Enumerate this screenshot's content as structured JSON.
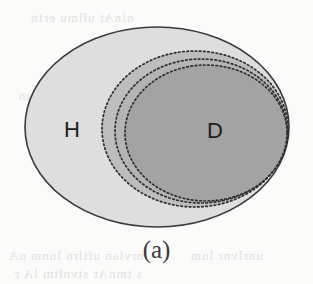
{
  "figure": {
    "caption": "(a)",
    "type": "venn-diagram",
    "background_color": "#fbfbfa",
    "sets": [
      {
        "id": "H",
        "label": "H",
        "label_x": 72,
        "label_y": 137,
        "shape": "ellipse",
        "cx": 157,
        "cy": 127,
        "rx": 132,
        "ry": 100,
        "fill": "#dedede",
        "stroke": "#3b3b3b",
        "stroke_style": "solid",
        "stroke_width": 1.6
      },
      {
        "id": "D3",
        "label": "",
        "shape": "ellipse",
        "cx": 195,
        "cy": 129,
        "rx": 93,
        "ry": 78,
        "fill": "#bdbdbd",
        "stroke": "#2e2e2e",
        "stroke_style": "dotted",
        "stroke_width": 1.7
      },
      {
        "id": "D2",
        "label": "",
        "shape": "ellipse",
        "cx": 201,
        "cy": 131,
        "rx": 86,
        "ry": 72,
        "fill": "#b4b4b4",
        "stroke": "#2e2e2e",
        "stroke_style": "dotted",
        "stroke_width": 1.7
      },
      {
        "id": "D",
        "label": "D",
        "label_x": 215,
        "label_y": 138,
        "shape": "ellipse",
        "cx": 206,
        "cy": 133,
        "rx": 81,
        "ry": 68,
        "fill": "#a3a3a3",
        "stroke": "#2e2e2e",
        "stroke_style": "dotted",
        "stroke_width": 1.7
      }
    ],
    "bleed_artifacts": [
      "bleed-line-top",
      "bleed-line-upper",
      "bleed-line-lower-left",
      "bleed-line-bottom",
      "bleed-line-lower-right"
    ]
  }
}
